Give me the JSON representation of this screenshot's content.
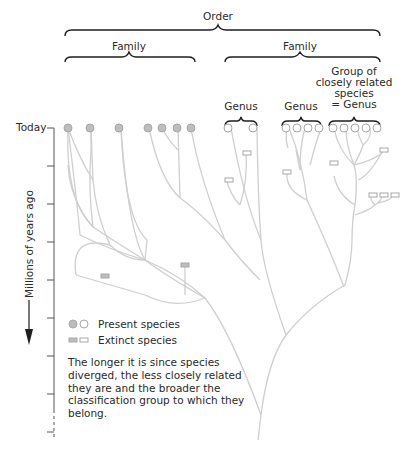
{
  "diagram": {
    "title_partial": "",
    "labels": {
      "order": "Order",
      "family_left": "Family",
      "family_right": "Family",
      "genus_1": "Genus",
      "genus_2": "Genus",
      "genus_group_line1": "Group of",
      "genus_group_line2": "closely related",
      "genus_group_line3": "species",
      "genus_group_line4": "= Genus"
    },
    "axis": {
      "today": "Today",
      "label": "Millions of years ago"
    },
    "legend": {
      "present": "Present species",
      "extinct": "Extinct species"
    },
    "note": "The longer it is since species diverged, the less closely related they are and the broader the classification group to which they belong.",
    "colors": {
      "line": "#cfcfcf",
      "present_fill_left": "#bdbdbd",
      "present_fill_right": "#ffffff",
      "node_stroke": "#a8a8a8",
      "text": "#2a2a2a"
    },
    "present_species_count": 20,
    "extinct_species_count": 9
  }
}
